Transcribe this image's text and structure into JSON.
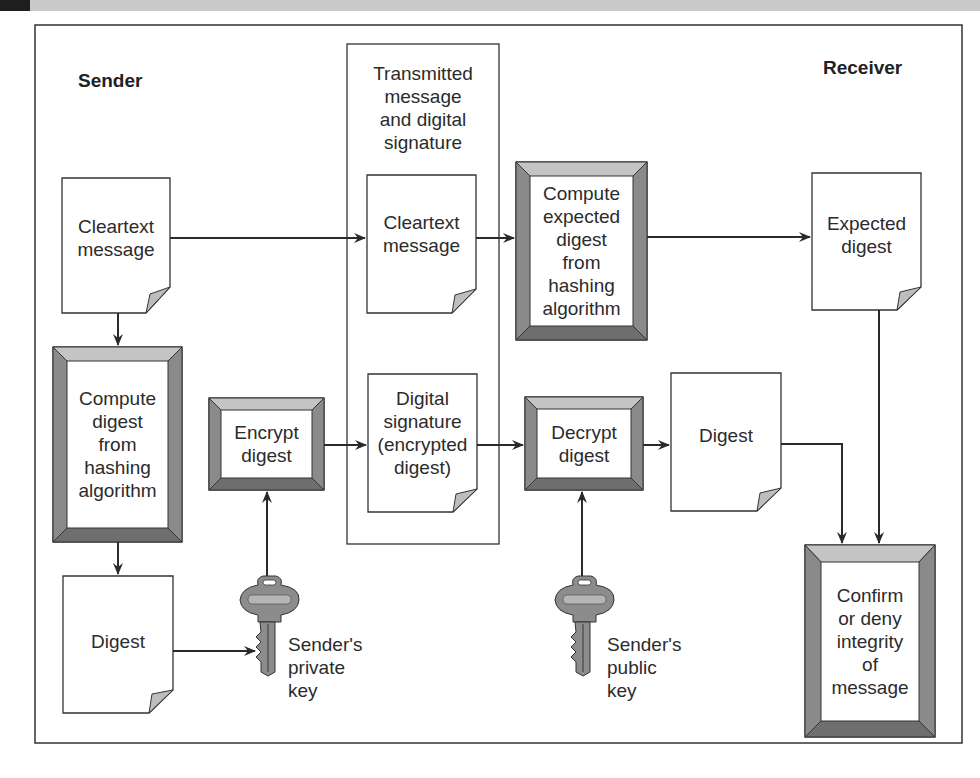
{
  "diagram": {
    "headings": {
      "sender": "Sender",
      "receiver": "Receiver",
      "transmitted": "Transmitted\nmessage\nand digital\nsignature"
    },
    "nodes": {
      "sender_cleartext": "Cleartext\nmessage",
      "sender_compute_digest": "Compute\ndigest\nfrom\nhashing\nalgorithm",
      "sender_digest": "Digest",
      "encrypt_digest": "Encrypt\ndigest",
      "private_key": "Sender's\nprivate\nkey",
      "transmitted_cleartext": "Cleartext\nmessage",
      "transmitted_signature": "Digital\nsignature\n(encrypted\ndigest)",
      "compute_expected": "Compute\nexpected\ndigest\nfrom\nhashing\nalgorithm",
      "expected_digest": "Expected\ndigest",
      "decrypt_digest": "Decrypt\ndigest",
      "receiver_digest": "Digest",
      "public_key": "Sender's\npublic\nkey",
      "confirm": "Confirm\nor deny\nintegrity\nof\nmessage"
    },
    "edges": [
      {
        "from": "sender_cleartext",
        "to": "transmitted_cleartext"
      },
      {
        "from": "transmitted_cleartext",
        "to": "compute_expected"
      },
      {
        "from": "compute_expected",
        "to": "expected_digest"
      },
      {
        "from": "expected_digest",
        "to": "confirm"
      },
      {
        "from": "sender_cleartext",
        "to": "sender_compute_digest"
      },
      {
        "from": "sender_compute_digest",
        "to": "sender_digest"
      },
      {
        "from": "sender_digest",
        "to": "private_key"
      },
      {
        "from": "private_key",
        "to": "encrypt_digest"
      },
      {
        "from": "encrypt_digest",
        "to": "transmitted_signature"
      },
      {
        "from": "transmitted_signature",
        "to": "decrypt_digest"
      },
      {
        "from": "public_key",
        "to": "decrypt_digest"
      },
      {
        "from": "decrypt_digest",
        "to": "receiver_digest"
      },
      {
        "from": "receiver_digest",
        "to": "confirm"
      }
    ],
    "colors": {
      "line": "#2a2a2a",
      "bevel_top": "#c4c4c4",
      "bevel_side": "#8a8a8a",
      "bevel_bottom": "#6e6e6e",
      "page_fold": "#bdbdbd",
      "key": "#8c8c8c"
    }
  }
}
